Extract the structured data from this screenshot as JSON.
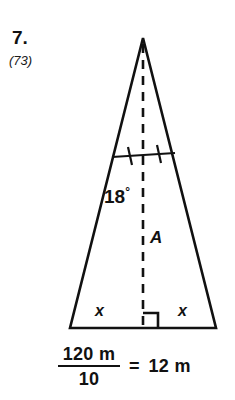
{
  "problem": {
    "number": "7.",
    "reference": "(73)"
  },
  "figure": {
    "type": "isosceles-triangle-with-altitude",
    "angle_label": "18",
    "degree_symbol": "°",
    "altitude_label": "A",
    "base_left_label": "x",
    "base_right_label": "x",
    "right_angle_marker": "square",
    "congruent_tick_count": 2,
    "altitude_style": "dashed",
    "stroke_color": "#111111",
    "fill_color": "#ffffff",
    "apex": {
      "x": 143,
      "y": 38
    },
    "base_left": {
      "x": 70,
      "y": 328
    },
    "base_right": {
      "x": 216,
      "y": 328
    },
    "foot": {
      "x": 143,
      "y": 328
    },
    "tick_line": {
      "x1": 112,
      "y1": 157,
      "x2": 175,
      "y2": 153
    }
  },
  "equation": {
    "numerator": "120 m",
    "denominator": "10",
    "equals": "=",
    "result": "12 m"
  }
}
